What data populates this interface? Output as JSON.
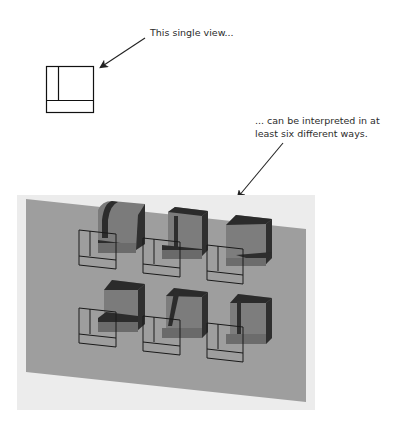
{
  "captions": {
    "top": "This single view...",
    "bottom_line1": "... can be interpreted in at",
    "bottom_line2": "least six different ways."
  },
  "figure": {
    "single_view": {
      "description": "orthographic view: square with vertical and horizontal inner lines"
    },
    "plane_color": "#9c9c9c",
    "solid_face_color": "#7e7e7e",
    "solid_dark_color": "#2e2e2e",
    "solid_shadow_color": "#6e6e6e",
    "interpretation_count": 6,
    "interpretations": [
      {
        "row": 1,
        "col": 1,
        "shape": "curved-top solid"
      },
      {
        "row": 1,
        "col": 2,
        "shape": "block with recessed front"
      },
      {
        "row": 1,
        "col": 3,
        "shape": "wedge with slanted face"
      },
      {
        "row": 2,
        "col": 1,
        "shape": "L-shaped block"
      },
      {
        "row": 2,
        "col": 2,
        "shape": "slanted-front block"
      },
      {
        "row": 2,
        "col": 3,
        "shape": "notched block"
      }
    ]
  }
}
